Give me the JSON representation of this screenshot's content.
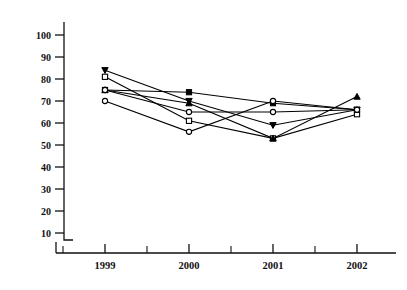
{
  "chart_data": {
    "type": "line",
    "title": "",
    "subtitle": "",
    "xlabel": "",
    "ylabel": "",
    "categories": [
      "1999",
      "2000",
      "2001",
      "2002"
    ],
    "x": [
      1999,
      2000,
      2001,
      2002
    ],
    "ylim": [
      0,
      105
    ],
    "xlim": [
      1998.45,
      2002.75
    ],
    "yticks": [
      10,
      20,
      30,
      40,
      50,
      60,
      70,
      80,
      90,
      100
    ],
    "ytick_labels": [
      "10",
      "20",
      "30",
      "40",
      "50",
      "60",
      "70",
      "80",
      "90",
      "100"
    ],
    "xtick_labels": [
      "1999",
      "2000",
      "2001",
      "2002"
    ],
    "x_minor_ticks": [
      1998.5,
      1999.5,
      2000.5,
      2001.5,
      2002.5
    ],
    "grid": false,
    "legend": "none",
    "annotations": [],
    "series": [
      {
        "name": "Series 1",
        "marker": "triangle-down-filled",
        "values": [
          84,
          70,
          59,
          66
        ]
      },
      {
        "name": "Series 2",
        "marker": "square-open",
        "values": [
          81,
          61,
          53,
          64
        ]
      },
      {
        "name": "Series 3",
        "marker": "square-filled",
        "values": [
          75,
          74,
          69,
          66
        ]
      },
      {
        "name": "Series 4",
        "marker": "triangle-up-filled",
        "values": [
          75,
          69,
          53,
          72
        ]
      },
      {
        "name": "Series 5",
        "marker": "circle-open",
        "values": [
          70,
          56,
          70,
          66
        ]
      },
      {
        "name": "Series 6",
        "marker": "circle-open-b",
        "values": [
          75,
          65,
          65,
          66
        ]
      }
    ]
  },
  "axes": {
    "y_axis_name": "value-axis",
    "x_axis_name": "year-axis"
  }
}
